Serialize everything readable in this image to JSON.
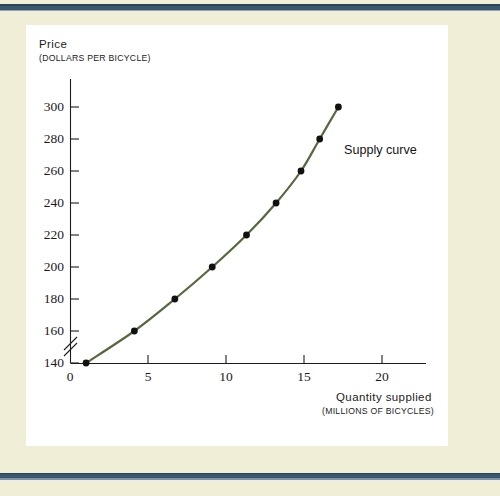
{
  "page": {
    "background_color": "#f0eed6",
    "rule_color": "#3a5572",
    "card_color": "#ffffff"
  },
  "chart_data": {
    "type": "line",
    "title": "",
    "subtitle": "",
    "ylabel": "Price",
    "ylabel_units": "(DOLLARS PER BICYCLE)",
    "xlabel": "Quantity supplied",
    "xlabel_units": "(MILLIONS OF BICYCLES)",
    "series_label": "Supply curve",
    "series_color": "#56683f",
    "marker_color": "#111111",
    "grid": false,
    "legend_position": "inline-right-of-curve",
    "axis_break": true,
    "xlim": [
      0,
      22.5
    ],
    "ylim": [
      130,
      310
    ],
    "xticks": [
      0,
      5,
      10,
      15,
      20
    ],
    "yticks": [
      140,
      160,
      180,
      200,
      220,
      240,
      260,
      280,
      300
    ],
    "xtick_labels": [
      "0",
      "5",
      "10",
      "15",
      "20"
    ],
    "ytick_labels": [
      "140",
      "160",
      "180",
      "200",
      "220",
      "240",
      "260",
      "280",
      "300"
    ],
    "series": [
      {
        "name": "Supply curve",
        "x": [
          1.0,
          4.1,
          6.7,
          9.1,
          11.3,
          13.2,
          14.8,
          16.0,
          17.2
        ],
        "y": [
          140,
          160,
          180,
          200,
          220,
          240,
          260,
          280,
          300
        ]
      }
    ],
    "points": [
      {
        "quantity": 1.0,
        "price": 140
      },
      {
        "quantity": 4.1,
        "price": 160
      },
      {
        "quantity": 6.7,
        "price": 180
      },
      {
        "quantity": 9.1,
        "price": 200
      },
      {
        "quantity": 11.3,
        "price": 220
      },
      {
        "quantity": 13.2,
        "price": 240
      },
      {
        "quantity": 14.8,
        "price": 260
      },
      {
        "quantity": 16.0,
        "price": 280
      },
      {
        "quantity": 17.2,
        "price": 300
      }
    ]
  }
}
